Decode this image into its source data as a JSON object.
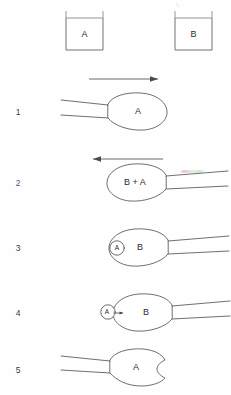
{
  "figure": {
    "background_color": "#fefefe",
    "ink_color": "#4a4a4a",
    "accent_color": "#6b4a78"
  },
  "vessels": [
    {
      "id": "vessel-a",
      "label": "A",
      "position": "left"
    },
    {
      "id": "vessel-b",
      "label": "B",
      "position": "right"
    }
  ],
  "arrows": [
    {
      "id": "arrow-right",
      "direction": "right",
      "above_step": "1"
    },
    {
      "id": "arrow-left",
      "direction": "left",
      "above_step": "2"
    }
  ],
  "steps": [
    {
      "number": "1",
      "bulb_label": "A",
      "tip_side": "left",
      "inner_marker": null,
      "notch": false,
      "description": "Pipette bulb filled with A, tip pointing left"
    },
    {
      "number": "2",
      "bulb_label": "B + A",
      "tip_side": "right",
      "inner_marker": null,
      "notch": false,
      "description": "Pipette bulb holds B + A, tip pointing right"
    },
    {
      "number": "3",
      "bulb_label": "B",
      "tip_side": "right",
      "inner_marker": {
        "label": "A",
        "shape": "circle",
        "arrow": false
      },
      "notch": false,
      "description": "Droplet A inside bulb at left edge alongside B"
    },
    {
      "number": "4",
      "bulb_label": "B",
      "tip_side": "right",
      "inner_marker": {
        "label": "A",
        "shape": "circle",
        "arrow": true
      },
      "notch": false,
      "description": "Droplet A at left edge with arrow indicating motion into B"
    },
    {
      "number": "5",
      "bulb_label": "A",
      "tip_side": "left",
      "inner_marker": null,
      "notch": true,
      "description": "Pipette bulb with A and a notch on the right side"
    }
  ],
  "artifacts": [
    {
      "id": "scan-color-fringe",
      "colors": [
        "#e060c0",
        "#c0d8a0",
        "#70c8a8"
      ],
      "near_step": "2"
    }
  ]
}
